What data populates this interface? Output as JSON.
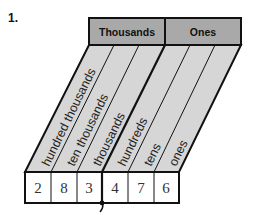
{
  "problem_number": "1.",
  "periods": [
    {
      "label": "Thousands"
    },
    {
      "label": "Ones"
    }
  ],
  "columns": [
    {
      "label": "hundred thousands",
      "digit": "2"
    },
    {
      "label": "ten thousands",
      "digit": "8"
    },
    {
      "label": "thousands",
      "digit": "3"
    },
    {
      "label": "hundreds",
      "digit": "4"
    },
    {
      "label": "tens",
      "digit": "7"
    },
    {
      "label": "ones",
      "digit": "6"
    }
  ],
  "colors": {
    "header_fill": "#a9a9a9",
    "slant_fill": "#d6d6d6",
    "box_fill": "#ffffff",
    "line": "#111111"
  }
}
